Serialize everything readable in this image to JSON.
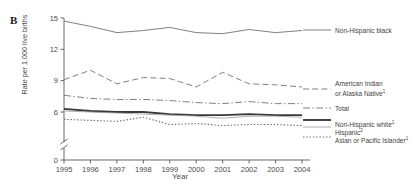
{
  "panel": {
    "label": "B"
  },
  "chart_data": {
    "type": "line",
    "title": "",
    "xlabel": "Year",
    "ylabel": "Rate per 1,000 live births",
    "x": [
      1995,
      1996,
      1997,
      1998,
      1999,
      2000,
      2001,
      2002,
      2003,
      2004
    ],
    "xtick_labels": [
      "1995",
      "1996",
      "1997",
      "1998",
      "1999",
      "2000",
      "2001",
      "2002",
      "2003",
      "2004"
    ],
    "ytick_labels": [
      "0",
      "6",
      "9",
      "12",
      "15"
    ],
    "ytick_values": [
      0,
      6,
      9,
      12,
      15
    ],
    "ylim": [
      0,
      15
    ],
    "axis_break": true,
    "axis_break_between": [
      0,
      6
    ],
    "grid": false,
    "legend_position": "right-inline",
    "series": [
      {
        "name": "Non-Hispanic black",
        "label": "Non-Hispanic black",
        "footnote": "",
        "style": "solid",
        "width": 1.0,
        "color": "#808080",
        "values": [
          14.7,
          14.2,
          13.6,
          13.8,
          14.1,
          13.6,
          13.5,
          13.9,
          13.6,
          13.8
        ]
      },
      {
        "name": "American Indian or Alaska Native",
        "label": "American Indian\nor Alaska Native",
        "footnote": "1",
        "style": "dashed",
        "width": 1.0,
        "color": "#808080",
        "values": [
          9.1,
          10.0,
          8.7,
          9.3,
          9.2,
          8.4,
          9.8,
          8.7,
          8.6,
          8.4
        ]
      },
      {
        "name": "Total",
        "label": "Total",
        "footnote": "",
        "style": "dashdot",
        "width": 1.0,
        "color": "#808080",
        "values": [
          7.6,
          7.3,
          7.2,
          7.2,
          7.1,
          6.9,
          6.8,
          7.0,
          6.8,
          6.8
        ]
      },
      {
        "name": "Non-Hispanic white",
        "label": "Non-Hispanic white",
        "footnote": "1",
        "style": "solid",
        "width": 1.9,
        "color": "#3a3a3a",
        "values": [
          6.3,
          6.1,
          6.0,
          6.0,
          5.8,
          5.7,
          5.7,
          5.8,
          5.7,
          5.7
        ]
      },
      {
        "name": "Hispanic",
        "label": "Hispanic",
        "footnote": "2",
        "style": "solid",
        "width": 0.8,
        "color": "#9a9a9a",
        "values": [
          6.1,
          6.0,
          5.9,
          5.8,
          5.7,
          5.6,
          5.4,
          5.6,
          5.6,
          5.5
        ]
      },
      {
        "name": "Asian or Pacific Islander",
        "label": "Asian or Pacific Islander",
        "footnote": "1",
        "style": "dotted",
        "width": 1.1,
        "color": "#6a6a6a",
        "values": [
          5.3,
          5.2,
          5.1,
          5.5,
          4.8,
          4.9,
          4.7,
          4.8,
          4.8,
          4.7
        ]
      }
    ]
  },
  "legend": {
    "items": [
      {
        "label": "Non-Hispanic black",
        "footnote": ""
      },
      {
        "label": "American Indian",
        "footnote": ""
      },
      {
        "label": "or Alaska Native",
        "footnote": "1"
      },
      {
        "label": "Total",
        "footnote": ""
      },
      {
        "label": "Non-Hispanic white",
        "footnote": "1"
      },
      {
        "label": "Hispanic",
        "footnote": "2"
      },
      {
        "label": "Asian or Pacific Islander",
        "footnote": "1"
      }
    ]
  }
}
